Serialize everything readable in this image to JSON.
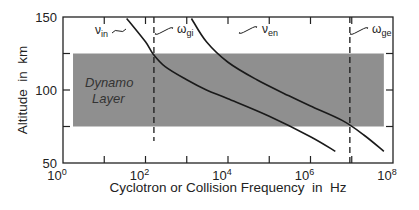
{
  "chart_data": {
    "type": "line",
    "title": "",
    "xlabel": "Cyclotron or Collision Frequency  in  Hz",
    "ylabel": "Altitude  in  km",
    "xscale": "log",
    "xlim": [
      1,
      100000000
    ],
    "ylim": [
      50,
      150
    ],
    "x_ticks": [
      {
        "value": 1,
        "label_base": "10",
        "label_exp": "0"
      },
      {
        "value": 10,
        "label_base": "",
        "label_exp": ""
      },
      {
        "value": 100,
        "label_base": "10",
        "label_exp": "2"
      },
      {
        "value": 1000,
        "label_base": "",
        "label_exp": ""
      },
      {
        "value": 10000,
        "label_base": "10",
        "label_exp": "4"
      },
      {
        "value": 100000,
        "label_base": "",
        "label_exp": ""
      },
      {
        "value": 1000000,
        "label_base": "10",
        "label_exp": "6"
      },
      {
        "value": 10000000,
        "label_base": "",
        "label_exp": ""
      },
      {
        "value": 100000000,
        "label_base": "10",
        "label_exp": "8"
      }
    ],
    "y_ticks": [
      {
        "value": 50,
        "label": "50"
      },
      {
        "value": 75,
        "label": ""
      },
      {
        "value": 100,
        "label": "100"
      },
      {
        "value": 125,
        "label": ""
      },
      {
        "value": 150,
        "label": "150"
      }
    ],
    "grid": false,
    "shaded_region": {
      "label_line1": "Dynamo",
      "label_line2": "Layer",
      "y_range": [
        75,
        125
      ],
      "x_range": [
        1.75,
        60000000
      ],
      "color": "#8f8f8f"
    },
    "series": [
      {
        "name": "ν_in",
        "label_base": "ν",
        "label_sub": "in",
        "style": "solid",
        "x": [
          35,
          100,
          150,
          300,
          1000,
          3000,
          10000,
          100000,
          1000000,
          4000000
        ],
        "y": [
          149,
          133,
          125,
          116,
          107,
          100,
          94,
          82,
          68,
          58
        ]
      },
      {
        "name": "ν_en",
        "label_base": "ν",
        "label_sub": "en",
        "style": "solid",
        "x": [
          1300,
          3000,
          10000,
          50000,
          300000,
          1000000,
          6000000,
          20000000,
          60000000
        ],
        "y": [
          149,
          133,
          119,
          107,
          96,
          89,
          79,
          69,
          58
        ]
      },
      {
        "name": "ω_gi",
        "label_base": "ω",
        "label_sub": "gi",
        "style": "dashed",
        "x": [
          160,
          160
        ],
        "y": [
          150,
          65
        ]
      },
      {
        "name": "ω_ge",
        "label_base": "ω",
        "label_sub": "ge",
        "style": "dashed",
        "x": [
          9000000,
          9000000
        ],
        "y": [
          150,
          50
        ]
      }
    ]
  },
  "colors": {
    "line": "#1a1a1a",
    "shade": "#8f8f8f",
    "frame": "#222222"
  }
}
